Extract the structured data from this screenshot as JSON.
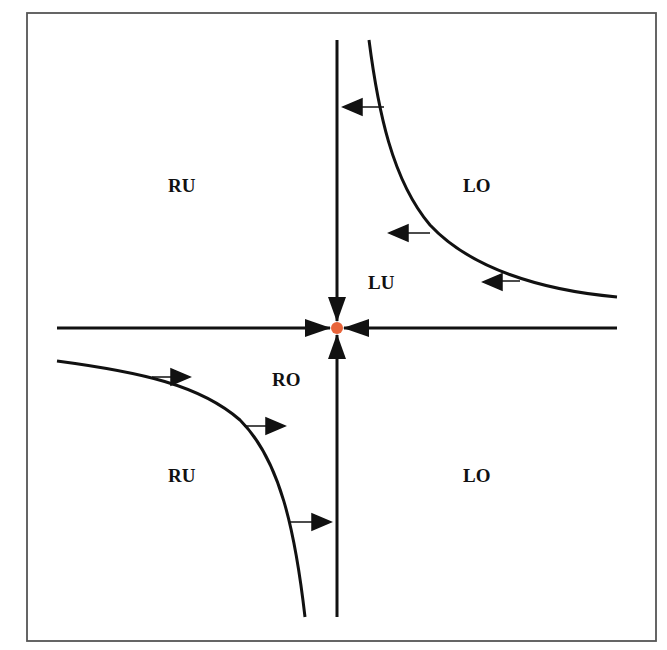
{
  "diagram": {
    "type": "phase-diagram",
    "frame": {
      "x": 27,
      "y": 13,
      "width": 629,
      "height": 628,
      "stroke": "#555555"
    },
    "colors": {
      "line": "#111111",
      "equilibrium": "#e8643a",
      "background": "#ffffff"
    },
    "axes": {
      "horizontal": {
        "x1": 57,
        "x2": 617,
        "y": 328
      },
      "vertical": {
        "x": 337,
        "y1": 40,
        "y2": 617
      }
    },
    "equilibrium_point": {
      "x": 337,
      "y": 328,
      "label": ""
    },
    "region_labels": [
      {
        "id": "ru-top",
        "text": "RU",
        "x": 168,
        "y": 192
      },
      {
        "id": "lo-top",
        "text": "LO",
        "x": 463,
        "y": 192
      },
      {
        "id": "lu",
        "text": "LU",
        "x": 368,
        "y": 289
      },
      {
        "id": "ro",
        "text": "RO",
        "x": 272,
        "y": 386
      },
      {
        "id": "ru-bottom",
        "text": "RU",
        "x": 168,
        "y": 482
      },
      {
        "id": "lo-bottom",
        "text": "LO",
        "x": 463,
        "y": 482
      }
    ],
    "curves": [
      {
        "id": "upper-right-hyperbola",
        "description": "curve in upper-right quadrant with leftward arrows"
      },
      {
        "id": "lower-left-hyperbola",
        "description": "curve in lower-left quadrant with rightward arrows"
      }
    ],
    "arrows": {
      "axis": [
        "right-to-center",
        "left-to-center",
        "top-to-center",
        "bottom-to-center"
      ],
      "upper_curve": "left",
      "lower_curve": "right"
    }
  }
}
